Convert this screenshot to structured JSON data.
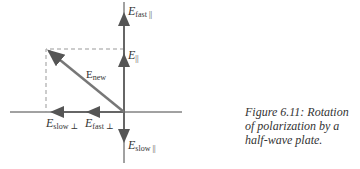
{
  "figure": {
    "caption": "Figure 6.11: Rotation of polarization by a half-wave plate.",
    "labels": {
      "e_fast_par": {
        "main": "E",
        "sub": "fast ||"
      },
      "e_par": {
        "main": "E",
        "sub": "||"
      },
      "e_new": {
        "main": "E",
        "sub": "new"
      },
      "e_slow_perp": {
        "main": "E",
        "sub": "slow ⊥"
      },
      "e_fast_perp": {
        "main": "E",
        "sub": "fast ⊥"
      },
      "e_slow_par": {
        "main": "E",
        "sub": "slow ||"
      }
    },
    "colors": {
      "axis": "#444444",
      "vector": "#777777",
      "dashed": "#999999",
      "text": "#333333"
    }
  }
}
